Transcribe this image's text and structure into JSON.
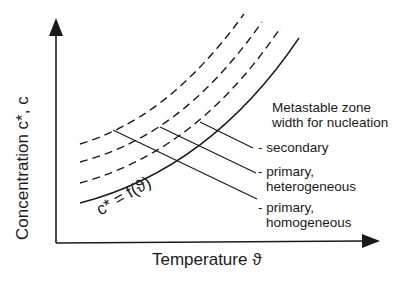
{
  "diagram": {
    "type": "metastable-zone-diagram",
    "axes": {
      "x_label": "Temperature ϑ",
      "y_label": "Concentration c*, c"
    },
    "curves": [
      {
        "id": "solubility",
        "style": "solid",
        "label": "c* = f(ϑ)"
      },
      {
        "id": "homogeneous-limit",
        "style": "dashed"
      },
      {
        "id": "heterogeneous-limit",
        "style": "dashed"
      },
      {
        "id": "secondary-limit",
        "style": "dashed"
      }
    ],
    "annotation_title": [
      "Metastable zone",
      "width for nucleation"
    ],
    "legend": [
      {
        "id": "secondary",
        "lines": [
          "- secondary"
        ]
      },
      {
        "id": "primary-heterogeneous",
        "lines": [
          "- primary,",
          "heterogeneous"
        ]
      },
      {
        "id": "primary-homogeneous",
        "lines": [
          "- primary,",
          "homogeneous"
        ]
      }
    ],
    "colors": {
      "ink": "#1a1a1a",
      "background": "#ffffff"
    }
  }
}
